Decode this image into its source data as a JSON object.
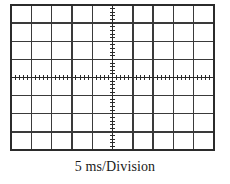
{
  "figure": {
    "kind": "oscilloscope-graticule",
    "caption": "5 ms/Division"
  },
  "graticule": {
    "divisions_x": 10,
    "divisions_y": 8,
    "left_px": 11,
    "top_px": 5,
    "right_px": 214,
    "bottom_px": 150,
    "grid_color": "#3a3a3a",
    "axis_color": "#2b2b2b",
    "border_color": "#2b2b2b",
    "background_color": "#ffffff",
    "grid_line_width": 1.4,
    "border_line_width": 1.8,
    "minor_ticks_per_division": 5,
    "tick_half_length_px": 2.2,
    "center_column_index": 5,
    "center_row_index": 4
  },
  "chart_data": {
    "type": "grid",
    "title": "",
    "caption": "5 ms/Division",
    "xlabel": "5 ms/Division",
    "ylabel": "",
    "x_divisions": 10,
    "y_divisions": 8,
    "time_per_division": "5 ms",
    "grid": true,
    "legend": "none",
    "series": []
  }
}
